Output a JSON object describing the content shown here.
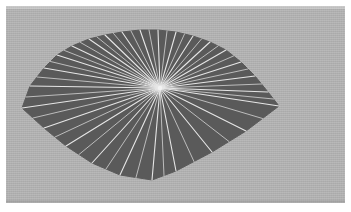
{
  "figure": {
    "kind": "geometric-diagram",
    "canvas": {
      "width": 351,
      "height": 212,
      "background": "#ffffff"
    },
    "panel": {
      "x": 6,
      "y": 6,
      "width": 339,
      "height": 197,
      "background_color": "#b3b3b3"
    },
    "polygon": {
      "fill_color": "#5a5a5a",
      "stroke_color": "#5a5a5a",
      "vertex_count": 22,
      "vertices": [
        [
          22,
          108
        ],
        [
          30,
          86
        ],
        [
          44,
          68
        ],
        [
          57,
          55
        ],
        [
          72,
          46
        ],
        [
          89,
          39
        ],
        [
          105,
          35
        ],
        [
          122,
          32
        ],
        [
          140,
          30
        ],
        [
          158,
          30
        ],
        [
          176,
          32
        ],
        [
          193,
          36
        ],
        [
          210,
          42
        ],
        [
          226,
          50
        ],
        [
          241,
          62
        ],
        [
          255,
          76
        ],
        [
          268,
          92
        ],
        [
          279,
          106
        ],
        [
          246,
          131
        ],
        [
          212,
          152
        ],
        [
          176,
          171
        ],
        [
          152,
          180
        ],
        [
          120,
          175
        ],
        [
          92,
          163
        ],
        [
          66,
          146
        ],
        [
          44,
          128
        ]
      ]
    },
    "center_point": {
      "x": 160,
      "y": 88,
      "label": "apex"
    },
    "spokes": {
      "count": 26,
      "stroke_color": "#e6e6e6",
      "stroke_width": 1.1,
      "description": "line segments from the interior apex to every polygon vertex"
    },
    "accent_colors": {
      "background_gray": "#b3b3b3",
      "polygon_gray": "#5a5a5a",
      "spoke_white": "#e6e6e6",
      "page_white": "#ffffff"
    }
  }
}
